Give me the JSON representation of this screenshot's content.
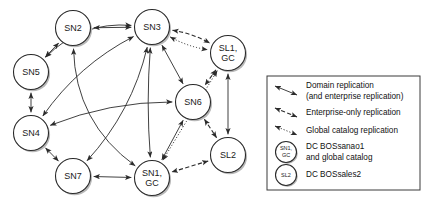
{
  "diagram": {
    "node_radius": 17.5,
    "colors": {
      "node_fill": "#ffffff",
      "node_stroke": "#2a2a2a",
      "edge": "#2b2b2b",
      "shadow": "#b8b8b8",
      "legend_border": "#3a3a3a",
      "background": "#ffffff"
    },
    "nodes": [
      {
        "id": "SN2",
        "label": "SN2",
        "sublabel": "",
        "cx": 73,
        "cy": 28
      },
      {
        "id": "SN3",
        "label": "SN3",
        "sublabel": "",
        "cx": 152,
        "cy": 27
      },
      {
        "id": "SL1",
        "label": "SL1,",
        "sublabel": "GC",
        "cx": 228,
        "cy": 53
      },
      {
        "id": "SN5",
        "label": "SN5",
        "sublabel": "",
        "cx": 31,
        "cy": 72
      },
      {
        "id": "SN6",
        "label": "SN6",
        "sublabel": "",
        "cx": 193,
        "cy": 102
      },
      {
        "id": "SN4",
        "label": "SN4",
        "sublabel": "",
        "cx": 31,
        "cy": 133
      },
      {
        "id": "SL2",
        "label": "SL2",
        "sublabel": "",
        "cx": 228,
        "cy": 155
      },
      {
        "id": "SN7",
        "label": "SN7",
        "sublabel": "",
        "cx": 73,
        "cy": 176
      },
      {
        "id": "SN1",
        "label": "SN1,",
        "sublabel": "GC",
        "cx": 152,
        "cy": 178
      }
    ],
    "edges": [
      {
        "from": "SN2",
        "to": "SN3",
        "style": "solid",
        "arrows": "both"
      },
      {
        "from": "SN2",
        "to": "SN5",
        "style": "solid",
        "arrows": "both"
      },
      {
        "from": "SN2",
        "to": "SN1",
        "style": "solid",
        "arrows": "both"
      },
      {
        "from": "SN3",
        "to": "SL1",
        "style": "dashed",
        "arrows": "both"
      },
      {
        "from": "SN3",
        "to": "SL1",
        "style": "dotted",
        "arrows": "both"
      },
      {
        "from": "SN3",
        "to": "SN6",
        "style": "solid",
        "arrows": "both"
      },
      {
        "from": "SN3",
        "to": "SN5",
        "style": "solid",
        "arrows": "both"
      },
      {
        "from": "SN3",
        "to": "SN4",
        "style": "solid",
        "arrows": "both"
      },
      {
        "from": "SN3",
        "to": "SN7",
        "style": "solid",
        "arrows": "both"
      },
      {
        "from": "SN3",
        "to": "SN1",
        "style": "solid",
        "arrows": "both"
      },
      {
        "from": "SL1",
        "to": "SN6",
        "style": "dashed",
        "arrows": "both"
      },
      {
        "from": "SL1",
        "to": "SL2",
        "style": "solid",
        "arrows": "both"
      },
      {
        "from": "SL1",
        "to": "SN1",
        "style": "dotted",
        "arrows": "both"
      },
      {
        "from": "SN5",
        "to": "SN4",
        "style": "solid",
        "arrows": "both"
      },
      {
        "from": "SN6",
        "to": "SN4",
        "style": "solid",
        "arrows": "both"
      },
      {
        "from": "SN6",
        "to": "SL2",
        "style": "dashed",
        "arrows": "both"
      },
      {
        "from": "SN6",
        "to": "SN1",
        "style": "solid",
        "arrows": "both"
      },
      {
        "from": "SN4",
        "to": "SN7",
        "style": "solid",
        "arrows": "both"
      },
      {
        "from": "SN7",
        "to": "SN1",
        "style": "solid",
        "arrows": "both"
      },
      {
        "from": "SL2",
        "to": "SN1",
        "style": "dashed",
        "arrows": "both"
      }
    ]
  },
  "legend": {
    "box": {
      "x": 267,
      "y": 76,
      "width": 153,
      "height": 114
    },
    "entries": [
      {
        "kind": "line",
        "style": "solid",
        "label_line1": "Domain replication",
        "label_line2": "(and enterprise replication)"
      },
      {
        "kind": "line",
        "style": "dashed",
        "label_line1": "Enterprise-only replication",
        "label_line2": ""
      },
      {
        "kind": "line",
        "style": "dotted",
        "label_line1": "Global catalog replication",
        "label_line2": ""
      },
      {
        "kind": "node",
        "node_label": "SN1,",
        "node_sublabel": "GC",
        "label_line1": "DC BOSsanao1",
        "label_line2": "and global catalog"
      },
      {
        "kind": "node",
        "node_label": "SL2",
        "node_sublabel": "",
        "label_line1": "DC BOSsales2",
        "label_line2": ""
      }
    ]
  }
}
